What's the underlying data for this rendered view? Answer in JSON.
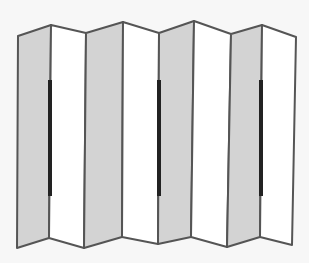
{
  "figure": {
    "panel_count": 8,
    "handle_count": 3,
    "colors": {
      "background": "#f7f7f7",
      "shaded_panel": "#d3d3d3",
      "light_panel": "#ffffff",
      "outline": "#555555",
      "handle": "#222222"
    },
    "top_vertices": [
      [
        18,
        36
      ],
      [
        51,
        25
      ],
      [
        86,
        33
      ],
      [
        123,
        22
      ],
      [
        159,
        33
      ],
      [
        194,
        21
      ],
      [
        231,
        34
      ],
      [
        262,
        25
      ],
      [
        296,
        37
      ]
    ],
    "bottom_vertices": [
      [
        17,
        248
      ],
      [
        49,
        238
      ],
      [
        84,
        248
      ],
      [
        122,
        237
      ],
      [
        158,
        244
      ],
      [
        191,
        237
      ],
      [
        227,
        247
      ],
      [
        260,
        237
      ],
      [
        292,
        245
      ]
    ],
    "shaded_panels": [
      0,
      2,
      4,
      6
    ],
    "handles": [
      {
        "x": 50,
        "y1": 80,
        "y2": 196
      },
      {
        "x": 159,
        "y1": 80,
        "y2": 196
      },
      {
        "x": 261,
        "y1": 80,
        "y2": 196
      }
    ]
  }
}
